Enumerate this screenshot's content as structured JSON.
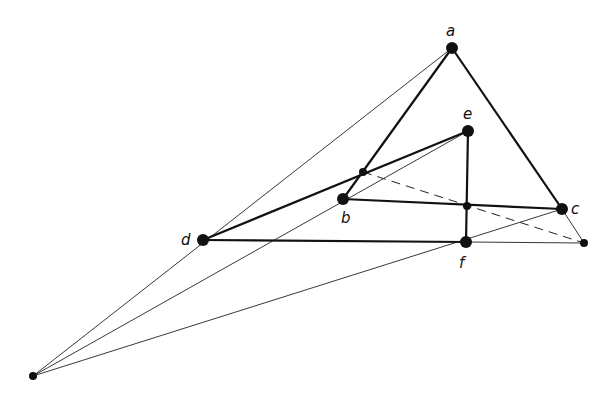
{
  "diagram": {
    "type": "desargues-configuration",
    "points": {
      "a": {
        "label": "a",
        "x": 452,
        "y": 48,
        "r": 6,
        "lx": 446,
        "ly": 36
      },
      "b": {
        "label": "b",
        "x": 343,
        "y": 199,
        "r": 6,
        "lx": 341,
        "ly": 223
      },
      "c": {
        "label": "c",
        "x": 562,
        "y": 209,
        "r": 6,
        "lx": 571,
        "ly": 214
      },
      "d": {
        "label": "d",
        "x": 203,
        "y": 240,
        "r": 6,
        "lx": 181,
        "ly": 245
      },
      "e": {
        "label": "e",
        "x": 468,
        "y": 131,
        "r": 6,
        "lx": 463,
        "ly": 119
      },
      "f": {
        "label": "f",
        "x": 466,
        "y": 242,
        "r": 6,
        "lx": 459,
        "ly": 268
      },
      "O": {
        "label": "",
        "x": 33,
        "y": 376,
        "r": 4
      },
      "P": {
        "label": "",
        "x": 584,
        "y": 243,
        "r": 4
      },
      "X1": {
        "label": "",
        "x": 363,
        "y": 172,
        "r": 4
      },
      "X2": {
        "label": "",
        "x": 467,
        "y": 206,
        "r": 4
      }
    },
    "thick_segments": [
      [
        "a",
        "b"
      ],
      [
        "a",
        "c"
      ],
      [
        "b",
        "c"
      ],
      [
        "d",
        "e"
      ],
      [
        "d",
        "f"
      ],
      [
        "e",
        "f"
      ]
    ],
    "thin_segments": [
      [
        "O",
        "a"
      ],
      [
        "O",
        "e"
      ],
      [
        "O",
        "c"
      ],
      [
        "c",
        "P"
      ],
      [
        "f",
        "P"
      ]
    ],
    "dashed_segments": [
      [
        "X1",
        "P"
      ]
    ]
  }
}
